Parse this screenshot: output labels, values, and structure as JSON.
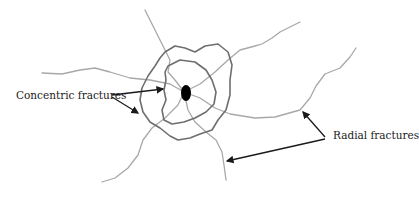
{
  "labels": {
    "concentric": "Concentric fractures",
    "radial": "Radial fractures"
  },
  "colors": {
    "radial_line": "#a8a8a8",
    "concentric_line": "#6e6e6e",
    "arrow": "#1a1a1a",
    "impact_point": "#000000",
    "background": "#ffffff"
  }
}
